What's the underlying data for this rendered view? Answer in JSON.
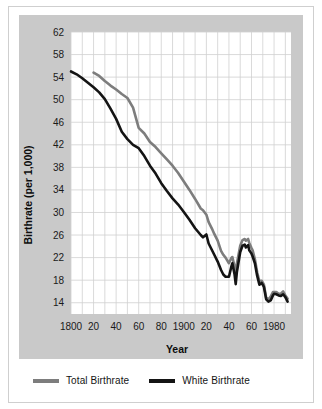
{
  "figure": {
    "background_color": "#ffffff",
    "panel_color": "#c9c9c9",
    "plot_bg_color": "#ffffff",
    "grid_color": "#d0d0d0",
    "frame_border_color": "#cfcfcf"
  },
  "axes": {
    "x_title": "Year",
    "y_title": "Birthrate (per 1,000)"
  },
  "legend": {
    "position": "bottom",
    "items": [
      {
        "label": "Total Birthrate",
        "color": "#7d7d7d"
      },
      {
        "label": "White Birthrate",
        "color": "#141414"
      }
    ]
  },
  "chart_data": {
    "type": "line",
    "title": "",
    "subtitle": "",
    "xlabel": "Year",
    "ylabel": "Birthrate (per 1,000)",
    "xlim": [
      1800,
      1995
    ],
    "ylim": [
      12,
      62
    ],
    "yticks": [
      14,
      18,
      22,
      26,
      30,
      34,
      38,
      42,
      46,
      50,
      54,
      58,
      62
    ],
    "ytick_labels": [
      "14",
      "18",
      "22",
      "26",
      "30",
      "34",
      "38",
      "42",
      "46",
      "50",
      "54",
      "58",
      "62"
    ],
    "xticks": [
      1800,
      1820,
      1840,
      1860,
      1880,
      1900,
      1920,
      1940,
      1960,
      1980
    ],
    "xtick_labels": [
      "1800",
      "20",
      "40",
      "60",
      "80",
      "1900",
      "20",
      "40",
      "60",
      "1980"
    ],
    "grid": true,
    "grid_x_step": 10,
    "grid_y_step": 4,
    "legend_position": "bottom",
    "series": [
      {
        "name": "Total Birthrate",
        "color": "#7d7d7d",
        "width": 2.6,
        "x": [
          1820,
          1825,
          1830,
          1835,
          1840,
          1845,
          1850,
          1855,
          1860,
          1865,
          1870,
          1875,
          1880,
          1885,
          1890,
          1895,
          1900,
          1905,
          1910,
          1915,
          1917,
          1920,
          1922,
          1925,
          1927,
          1930,
          1933,
          1935,
          1937,
          1940,
          1942,
          1943,
          1945,
          1946,
          1947,
          1950,
          1952,
          1954,
          1955,
          1957,
          1958,
          1960,
          1961,
          1963,
          1965,
          1967,
          1969,
          1971,
          1973,
          1975,
          1977,
          1979,
          1980,
          1982,
          1984,
          1986,
          1988,
          1990,
          1992
        ],
        "y": [
          54.8,
          54.2,
          53.3,
          52.5,
          51.8,
          51.0,
          50.3,
          48.6,
          45.0,
          44.0,
          42.5,
          41.6,
          40.5,
          39.4,
          38.3,
          37.0,
          35.5,
          34.0,
          32.4,
          30.7,
          30.4,
          29.6,
          28.3,
          27.1,
          26.2,
          25.0,
          23.2,
          22.5,
          22.0,
          21.0,
          21.9,
          22.1,
          20.4,
          19.2,
          20.9,
          24.1,
          25.1,
          25.3,
          25.0,
          25.3,
          24.6,
          23.7,
          23.3,
          21.7,
          19.4,
          17.8,
          17.9,
          17.2,
          14.9,
          14.6,
          15.1,
          15.9,
          15.9,
          15.9,
          15.6,
          15.6,
          16.0,
          15.3,
          14.7
        ]
      },
      {
        "name": "White Birthrate",
        "color": "#141414",
        "width": 2.6,
        "x": [
          1800,
          1805,
          1810,
          1815,
          1820,
          1825,
          1830,
          1835,
          1840,
          1845,
          1850,
          1855,
          1860,
          1865,
          1870,
          1875,
          1880,
          1885,
          1890,
          1895,
          1900,
          1905,
          1910,
          1915,
          1917,
          1920,
          1922,
          1925,
          1927,
          1930,
          1933,
          1935,
          1937,
          1940,
          1942,
          1943,
          1945,
          1946,
          1947,
          1950,
          1952,
          1954,
          1955,
          1957,
          1958,
          1960,
          1961,
          1963,
          1965,
          1967,
          1969,
          1971,
          1973,
          1975,
          1977,
          1979,
          1980,
          1982,
          1984,
          1986,
          1988,
          1990,
          1992
        ],
        "y": [
          55.0,
          54.5,
          53.8,
          53.0,
          52.2,
          51.3,
          50.1,
          48.4,
          46.6,
          44.3,
          43.0,
          42.0,
          41.4,
          40.0,
          38.3,
          36.9,
          35.2,
          33.8,
          32.5,
          31.4,
          30.1,
          28.7,
          27.2,
          26.0,
          25.6,
          26.1,
          24.5,
          23.3,
          22.5,
          21.3,
          19.8,
          19.0,
          18.6,
          18.6,
          20.3,
          21.0,
          19.0,
          17.3,
          19.4,
          23.0,
          24.1,
          24.3,
          23.8,
          24.2,
          23.3,
          22.7,
          22.2,
          21.0,
          18.8,
          17.2,
          17.5,
          16.8,
          14.6,
          14.2,
          14.4,
          15.3,
          15.6,
          15.5,
          15.3,
          15.2,
          15.5,
          15.0,
          14.2
        ]
      }
    ]
  }
}
